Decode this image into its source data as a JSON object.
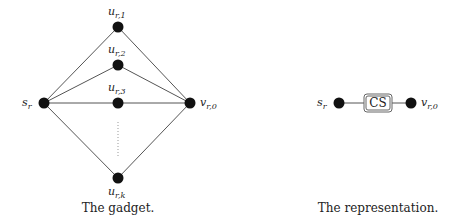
{
  "gadget": {
    "caption": "The gadget.",
    "nodes": [
      {
        "id": "s_r",
        "base": "s",
        "sub": "r",
        "x": 44,
        "y": 103
      },
      {
        "id": "u_r1",
        "base": "u",
        "sub": "r,1",
        "x": 118,
        "y": 27
      },
      {
        "id": "u_r2",
        "base": "u",
        "sub": "r,2",
        "x": 118,
        "y": 65
      },
      {
        "id": "u_r3",
        "base": "u",
        "sub": "r,3",
        "x": 118,
        "y": 103
      },
      {
        "id": "u_rk",
        "base": "u",
        "sub": "r,k",
        "x": 118,
        "y": 178
      },
      {
        "id": "v_r0",
        "base": "v",
        "sub": "r,0",
        "x": 190,
        "y": 103
      }
    ],
    "labels": {
      "s_r": {
        "base": "s",
        "sub": "r"
      },
      "u_r1": {
        "base": "u",
        "sub": "r,1"
      },
      "u_r2": {
        "base": "u",
        "sub": "r,2"
      },
      "u_r3": {
        "base": "u",
        "sub": "r,3"
      },
      "u_rk": {
        "base": "u",
        "sub": "r,k"
      },
      "v_r0": {
        "base": "v",
        "sub": "r,0"
      }
    }
  },
  "representation": {
    "caption": "The representation.",
    "box_label": "CS",
    "labels": {
      "s_r": {
        "base": "s",
        "sub": "r"
      },
      "v_r0": {
        "base": "v",
        "sub": "r,0"
      }
    }
  }
}
